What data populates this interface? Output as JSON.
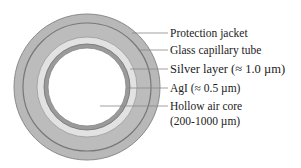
{
  "diagram": {
    "type": "cross-section",
    "layers": [
      {
        "name": "Protection jacket",
        "color": "#b4b4b4"
      },
      {
        "name": "Glass capillary tube",
        "color": "#b9b9b9"
      },
      {
        "name": "Silver layer",
        "thickness": "≈ 1.0 µm",
        "color": "#e4e4e4"
      },
      {
        "name": "AgI",
        "thickness": "≈ 0.5 µm",
        "color": "#8e8e8e"
      },
      {
        "name": "Hollow air core",
        "size": "200-1000 µm",
        "color": "#ffffff"
      }
    ]
  },
  "labels": {
    "jacket": "Protection jacket",
    "glass": "Glass capillary tube",
    "silver": "Silver layer (≈ 1.0 µm)",
    "agi": "AgI (≈ 0.5 µm)",
    "core_line1": "Hollow air core",
    "core_line2": "(200-1000 µm)"
  }
}
